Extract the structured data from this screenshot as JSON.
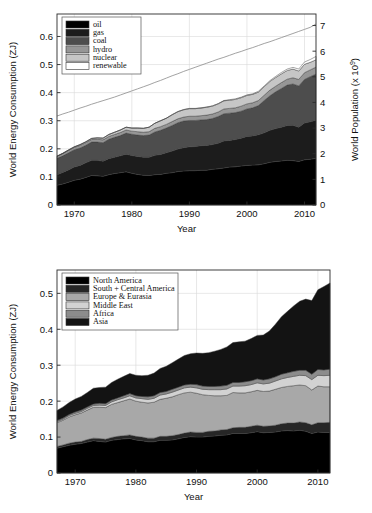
{
  "page": {
    "background": "#ffffff",
    "width": 372,
    "height": 513
  },
  "chart_data": [
    {
      "id": "world-energy-by-source",
      "type": "area",
      "stacked": true,
      "title": "",
      "xlabel": "Year",
      "ylabel": "World Energy Consumption (ZJ)",
      "y2label": "World Population (x 10⁹)",
      "xlim": [
        1967,
        2012
      ],
      "ylim": [
        0,
        0.68
      ],
      "y2lim": [
        0,
        7.45
      ],
      "xticks": [
        1970,
        1980,
        1990,
        2000,
        2010
      ],
      "xticklabels": [
        "1970",
        "1980",
        "1990",
        "2000",
        "2010"
      ],
      "yticks": [
        0,
        0.1,
        0.2,
        0.3,
        0.4,
        0.5,
        0.6
      ],
      "yticklabels": [
        "0",
        "0.1",
        "0.2",
        "0.3",
        "0.4",
        "0.5",
        "0.6"
      ],
      "y2ticks": [
        0,
        1,
        2,
        3,
        4,
        5,
        6,
        7
      ],
      "y2ticklabels": [
        "0",
        "1",
        "2",
        "3",
        "4",
        "5",
        "6",
        "7"
      ],
      "grid": true,
      "legend_position": "upper-left",
      "x": [
        1967,
        1968,
        1969,
        1970,
        1971,
        1972,
        1973,
        1974,
        1975,
        1976,
        1977,
        1978,
        1979,
        1980,
        1981,
        1982,
        1983,
        1984,
        1985,
        1986,
        1987,
        1988,
        1989,
        1990,
        1991,
        1992,
        1993,
        1994,
        1995,
        1996,
        1997,
        1998,
        1999,
        2000,
        2001,
        2002,
        2003,
        2004,
        2005,
        2006,
        2007,
        2008,
        2009,
        2010,
        2011,
        2012
      ],
      "series": [
        {
          "name": "oil",
          "color": "#000000",
          "values": [
            0.07,
            0.075,
            0.081,
            0.088,
            0.092,
            0.098,
            0.105,
            0.104,
            0.102,
            0.108,
            0.112,
            0.115,
            0.118,
            0.113,
            0.109,
            0.106,
            0.105,
            0.108,
            0.109,
            0.113,
            0.115,
            0.119,
            0.121,
            0.122,
            0.122,
            0.124,
            0.124,
            0.127,
            0.129,
            0.132,
            0.135,
            0.136,
            0.139,
            0.141,
            0.142,
            0.143,
            0.147,
            0.152,
            0.155,
            0.157,
            0.159,
            0.158,
            0.155,
            0.161,
            0.163,
            0.166
          ]
        },
        {
          "name": "gas",
          "color": "#1c1c1c",
          "values": [
            0.038,
            0.041,
            0.044,
            0.047,
            0.049,
            0.052,
            0.054,
            0.055,
            0.054,
            0.057,
            0.058,
            0.06,
            0.063,
            0.063,
            0.064,
            0.064,
            0.065,
            0.069,
            0.071,
            0.073,
            0.077,
            0.08,
            0.083,
            0.085,
            0.086,
            0.087,
            0.088,
            0.088,
            0.091,
            0.096,
            0.095,
            0.097,
            0.099,
            0.103,
            0.104,
            0.107,
            0.11,
            0.114,
            0.117,
            0.12,
            0.124,
            0.126,
            0.122,
            0.131,
            0.133,
            0.136
          ]
        },
        {
          "name": "coal",
          "color": "#4d4d4d",
          "values": [
            0.058,
            0.059,
            0.061,
            0.062,
            0.062,
            0.063,
            0.065,
            0.065,
            0.066,
            0.069,
            0.071,
            0.072,
            0.075,
            0.076,
            0.076,
            0.077,
            0.079,
            0.083,
            0.086,
            0.088,
            0.091,
            0.094,
            0.095,
            0.094,
            0.093,
            0.092,
            0.092,
            0.093,
            0.095,
            0.097,
            0.097,
            0.096,
            0.096,
            0.098,
            0.1,
            0.104,
            0.115,
            0.123,
            0.131,
            0.138,
            0.144,
            0.147,
            0.147,
            0.155,
            0.161,
            0.164
          ]
        },
        {
          "name": "hydro",
          "color": "#969696",
          "values": [
            0.007,
            0.008,
            0.008,
            0.008,
            0.009,
            0.009,
            0.009,
            0.01,
            0.01,
            0.01,
            0.01,
            0.011,
            0.011,
            0.011,
            0.012,
            0.012,
            0.012,
            0.013,
            0.013,
            0.013,
            0.014,
            0.014,
            0.014,
            0.015,
            0.015,
            0.015,
            0.016,
            0.016,
            0.016,
            0.017,
            0.017,
            0.017,
            0.018,
            0.018,
            0.018,
            0.018,
            0.019,
            0.02,
            0.02,
            0.021,
            0.021,
            0.022,
            0.023,
            0.024,
            0.024,
            0.025
          ]
        },
        {
          "name": "nuclear",
          "color": "#c6c6c6",
          "values": [
            0.001,
            0.001,
            0.002,
            0.002,
            0.003,
            0.003,
            0.004,
            0.005,
            0.006,
            0.007,
            0.008,
            0.009,
            0.01,
            0.011,
            0.013,
            0.014,
            0.016,
            0.018,
            0.021,
            0.022,
            0.024,
            0.025,
            0.026,
            0.027,
            0.027,
            0.027,
            0.028,
            0.028,
            0.029,
            0.029,
            0.029,
            0.03,
            0.03,
            0.03,
            0.03,
            0.03,
            0.03,
            0.031,
            0.031,
            0.031,
            0.031,
            0.031,
            0.03,
            0.03,
            0.027,
            0.026
          ]
        },
        {
          "name": "renewable",
          "color": "#ffffff",
          "values": [
            0.0,
            0.0,
            0.0,
            0.0,
            0.0,
            0.0,
            0.0,
            0.0,
            0.0,
            0.0,
            0.0,
            0.0,
            0.0,
            0.0,
            0.0,
            0.0,
            0.0,
            0.0,
            0.0,
            0.0,
            0.001,
            0.001,
            0.001,
            0.001,
            0.001,
            0.001,
            0.001,
            0.001,
            0.001,
            0.001,
            0.002,
            0.002,
            0.002,
            0.002,
            0.002,
            0.003,
            0.003,
            0.003,
            0.004,
            0.005,
            0.005,
            0.006,
            0.007,
            0.008,
            0.01,
            0.012
          ]
        }
      ],
      "overlay_line": {
        "name": "World Population",
        "color": "#8a8a8a",
        "axis": "right",
        "values": [
          3.47,
          3.55,
          3.62,
          3.7,
          3.78,
          3.85,
          3.93,
          4.0,
          4.07,
          4.14,
          4.21,
          4.29,
          4.37,
          4.45,
          4.53,
          4.61,
          4.69,
          4.78,
          4.86,
          4.95,
          5.04,
          5.12,
          5.21,
          5.29,
          5.37,
          5.45,
          5.53,
          5.61,
          5.69,
          5.76,
          5.84,
          5.92,
          5.99,
          6.07,
          6.14,
          6.22,
          6.3,
          6.37,
          6.45,
          6.53,
          6.61,
          6.69,
          6.77,
          6.85,
          6.93,
          7.06
        ]
      }
    },
    {
      "id": "world-energy-by-region",
      "type": "area",
      "stacked": true,
      "title": "",
      "xlabel": "Year",
      "ylabel": "World Energy Consumption (ZJ)",
      "xlim": [
        1967,
        2012
      ],
      "ylim": [
        0,
        0.565
      ],
      "xticks": [
        1970,
        1980,
        1990,
        2000,
        2010
      ],
      "xticklabels": [
        "1970",
        "1980",
        "1990",
        "2000",
        "2010"
      ],
      "yticks": [
        0,
        0.1,
        0.2,
        0.3,
        0.4,
        0.5
      ],
      "yticklabels": [
        "0",
        "0.1",
        "0.2",
        "0.3",
        "0.4",
        "0.5"
      ],
      "grid": true,
      "legend_position": "upper-left",
      "x": [
        1967,
        1968,
        1969,
        1970,
        1971,
        1972,
        1973,
        1974,
        1975,
        1976,
        1977,
        1978,
        1979,
        1980,
        1981,
        1982,
        1983,
        1984,
        1985,
        1986,
        1987,
        1988,
        1989,
        1990,
        1991,
        1992,
        1993,
        1994,
        1995,
        1996,
        1997,
        1998,
        1999,
        2000,
        2001,
        2002,
        2003,
        2004,
        2005,
        2006,
        2007,
        2008,
        2009,
        2010,
        2011,
        2012
      ],
      "series": [
        {
          "name": "North America",
          "color": "#000000",
          "values": [
            0.069,
            0.073,
            0.077,
            0.08,
            0.082,
            0.086,
            0.09,
            0.088,
            0.086,
            0.091,
            0.093,
            0.095,
            0.096,
            0.092,
            0.09,
            0.087,
            0.087,
            0.091,
            0.091,
            0.092,
            0.095,
            0.099,
            0.101,
            0.1,
            0.1,
            0.102,
            0.103,
            0.105,
            0.106,
            0.11,
            0.11,
            0.11,
            0.112,
            0.115,
            0.112,
            0.113,
            0.114,
            0.117,
            0.118,
            0.117,
            0.119,
            0.116,
            0.11,
            0.114,
            0.113,
            0.113
          ]
        },
        {
          "name": "South + Central America",
          "color": "#262626",
          "values": [
            0.005,
            0.005,
            0.006,
            0.006,
            0.006,
            0.007,
            0.007,
            0.008,
            0.008,
            0.008,
            0.009,
            0.009,
            0.01,
            0.01,
            0.01,
            0.01,
            0.01,
            0.011,
            0.011,
            0.012,
            0.012,
            0.012,
            0.013,
            0.013,
            0.013,
            0.014,
            0.014,
            0.015,
            0.015,
            0.016,
            0.017,
            0.017,
            0.018,
            0.018,
            0.018,
            0.018,
            0.019,
            0.02,
            0.021,
            0.022,
            0.023,
            0.024,
            0.024,
            0.026,
            0.027,
            0.028
          ]
        },
        {
          "name": "Europe & Eurasia",
          "color": "#a8a8a8",
          "values": [
            0.066,
            0.069,
            0.073,
            0.076,
            0.079,
            0.082,
            0.086,
            0.087,
            0.088,
            0.092,
            0.094,
            0.097,
            0.1,
            0.098,
            0.097,
            0.098,
            0.1,
            0.103,
            0.106,
            0.108,
            0.111,
            0.112,
            0.111,
            0.109,
            0.105,
            0.1,
            0.098,
            0.095,
            0.095,
            0.098,
            0.096,
            0.096,
            0.096,
            0.097,
            0.097,
            0.097,
            0.1,
            0.101,
            0.102,
            0.104,
            0.103,
            0.103,
            0.097,
            0.102,
            0.1,
            0.099
          ]
        },
        {
          "name": "Middle East",
          "color": "#d2d2d2",
          "values": [
            0.003,
            0.003,
            0.004,
            0.004,
            0.004,
            0.005,
            0.005,
            0.006,
            0.006,
            0.007,
            0.008,
            0.008,
            0.009,
            0.009,
            0.01,
            0.01,
            0.011,
            0.012,
            0.012,
            0.013,
            0.013,
            0.014,
            0.014,
            0.015,
            0.015,
            0.016,
            0.017,
            0.017,
            0.018,
            0.018,
            0.019,
            0.02,
            0.02,
            0.021,
            0.021,
            0.022,
            0.023,
            0.024,
            0.025,
            0.026,
            0.027,
            0.028,
            0.029,
            0.03,
            0.031,
            0.032
          ]
        },
        {
          "name": "Africa",
          "color": "#8c8c8c",
          "values": [
            0.003,
            0.003,
            0.003,
            0.004,
            0.004,
            0.004,
            0.004,
            0.005,
            0.005,
            0.005,
            0.005,
            0.006,
            0.006,
            0.006,
            0.006,
            0.007,
            0.007,
            0.007,
            0.007,
            0.008,
            0.008,
            0.008,
            0.008,
            0.009,
            0.009,
            0.009,
            0.009,
            0.01,
            0.01,
            0.01,
            0.01,
            0.011,
            0.011,
            0.011,
            0.011,
            0.012,
            0.012,
            0.013,
            0.013,
            0.014,
            0.014,
            0.015,
            0.015,
            0.016,
            0.016,
            0.017
          ]
        },
        {
          "name": "Asia",
          "color": "#131313",
          "values": [
            0.028,
            0.031,
            0.033,
            0.036,
            0.038,
            0.04,
            0.044,
            0.044,
            0.046,
            0.049,
            0.052,
            0.054,
            0.056,
            0.057,
            0.058,
            0.06,
            0.063,
            0.067,
            0.07,
            0.074,
            0.078,
            0.082,
            0.085,
            0.088,
            0.091,
            0.094,
            0.098,
            0.102,
            0.107,
            0.111,
            0.113,
            0.113,
            0.117,
            0.121,
            0.125,
            0.133,
            0.146,
            0.16,
            0.171,
            0.182,
            0.192,
            0.198,
            0.205,
            0.222,
            0.232,
            0.24
          ]
        }
      ]
    }
  ]
}
